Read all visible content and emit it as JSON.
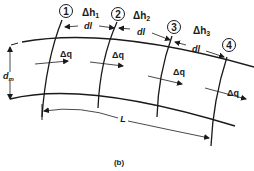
{
  "diagram": {
    "type": "flow-channel-sections",
    "caption": "(b)",
    "sections": [
      {
        "id": "1",
        "label": "1"
      },
      {
        "id": "2",
        "label": "2"
      },
      {
        "id": "3",
        "label": "3"
      },
      {
        "id": "4",
        "label": "4"
      }
    ],
    "head_losses": [
      {
        "label_prefix": "Δh",
        "subscript": "1"
      },
      {
        "label_prefix": "Δh",
        "subscript": "2"
      },
      {
        "label_prefix": "Δh",
        "subscript": "3"
      }
    ],
    "segment_length_labels": [
      "dl",
      "dl",
      "dl"
    ],
    "flow_labels": [
      "Δq",
      "Δq",
      "Δq",
      "Δq"
    ],
    "depth_label": {
      "prefix": "d",
      "subscript": "m"
    },
    "total_length_label": "L",
    "colors": {
      "line": "#1a1a1a",
      "background": "#ffffff"
    }
  }
}
